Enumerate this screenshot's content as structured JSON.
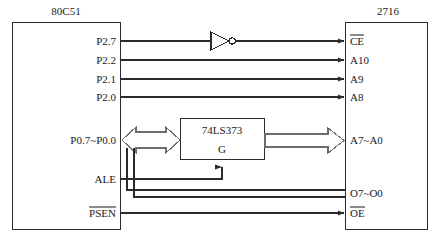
{
  "diagram": {
    "stroke_color": "#2b2b2b",
    "background": "#ffffff"
  },
  "chips": {
    "mcu": {
      "name": "80C51",
      "label_x": 66,
      "label_y": 11,
      "box": {
        "x": 12,
        "y": 22,
        "w": 108,
        "h": 208
      },
      "pins": [
        {
          "id": "p27",
          "label": "P2.7",
          "y": 41,
          "overline": false
        },
        {
          "id": "p22",
          "label": "P2.2",
          "y": 60,
          "overline": false
        },
        {
          "id": "p21",
          "label": "P2.1",
          "y": 79,
          "overline": false
        },
        {
          "id": "p20",
          "label": "P2.0",
          "y": 97,
          "overline": false
        },
        {
          "id": "p0",
          "label": "P0.7~P0.0",
          "y": 140,
          "overline": false
        },
        {
          "id": "ale",
          "label": "ALE",
          "y": 179,
          "overline": false
        },
        {
          "id": "psen",
          "label": "PSEN",
          "y": 213,
          "overline": true
        }
      ]
    },
    "eprom": {
      "name": "2716",
      "label_x": 388,
      "label_y": 11,
      "box": {
        "x": 345,
        "y": 22,
        "w": 83,
        "h": 208
      },
      "pins": [
        {
          "id": "ce",
          "label": "CE",
          "y": 41,
          "overline": true
        },
        {
          "id": "a10",
          "label": "A10",
          "y": 60,
          "overline": false
        },
        {
          "id": "a9",
          "label": "A9",
          "y": 79,
          "overline": false
        },
        {
          "id": "a8",
          "label": "A8",
          "y": 97,
          "overline": false
        },
        {
          "id": "a7a0",
          "label": "A7~A0",
          "y": 140,
          "overline": false
        },
        {
          "id": "o7o0",
          "label": "O7~O0",
          "y": 193,
          "overline": false
        },
        {
          "id": "oe",
          "label": "OE",
          "y": 213,
          "overline": true
        }
      ]
    },
    "latch": {
      "name": "74LS373",
      "gate_label": "G",
      "box": {
        "x": 180,
        "y": 118,
        "w": 85,
        "h": 42
      },
      "name_x": 222,
      "name_y": 130,
      "gate_x": 222,
      "gate_y": 149
    }
  },
  "components": {
    "inverter": {
      "name": "NOT gate",
      "tip_x": 232,
      "apex_x": 211,
      "y": 41,
      "half_height": 9,
      "bubble_r": 3
    }
  },
  "nets": [
    {
      "id": "net-p27-ce",
      "from": "P2.7",
      "to": "CE",
      "via": "inverter"
    },
    {
      "id": "net-p22-a10",
      "from": "P2.2",
      "to": "A10",
      "via": ""
    },
    {
      "id": "net-p21-a9",
      "from": "P2.1",
      "to": "A9",
      "via": ""
    },
    {
      "id": "net-p20-a8",
      "from": "P2.0",
      "to": "A8",
      "via": ""
    },
    {
      "id": "net-p0-latch",
      "from": "P0.7~P0.0",
      "to": "74LS373",
      "via": "bidirectional bus"
    },
    {
      "id": "net-latch-a",
      "from": "74LS373",
      "to": "A7~A0",
      "via": "bus"
    },
    {
      "id": "net-p0-data",
      "from": "P0.7~P0.0",
      "to": "O7~O0",
      "via": ""
    },
    {
      "id": "net-ale-g",
      "from": "ALE",
      "to": "G",
      "via": ""
    },
    {
      "id": "net-psen-oe",
      "from": "PSEN",
      "to": "OE",
      "via": ""
    }
  ]
}
